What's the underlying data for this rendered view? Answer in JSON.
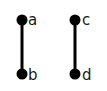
{
  "diagram": {
    "type": "graph",
    "nodes": [
      {
        "id": "a",
        "label": "a",
        "x": 22,
        "y": 20
      },
      {
        "id": "b",
        "label": "b",
        "x": 22,
        "y": 74
      },
      {
        "id": "c",
        "label": "c",
        "x": 75,
        "y": 20
      },
      {
        "id": "d",
        "label": "d",
        "x": 75,
        "y": 74
      }
    ],
    "edges": [
      {
        "from": "a",
        "to": "b"
      },
      {
        "from": "c",
        "to": "d"
      }
    ],
    "colors": {
      "node": "#000000",
      "edge": "#000000",
      "label": "#1a1a1a",
      "background": "#ffffff"
    }
  }
}
